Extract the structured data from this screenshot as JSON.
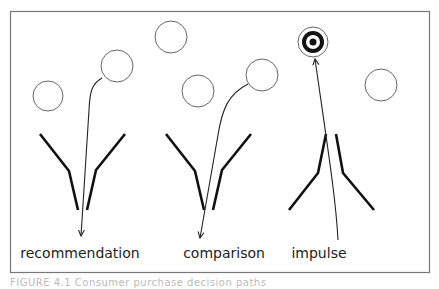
{
  "diagram": {
    "frame": {
      "x": 10,
      "y": 11,
      "width": 420,
      "height": 262,
      "stroke": "#777777"
    },
    "colors": {
      "line": "#111111",
      "circle": "#666666",
      "arrow": "#222222"
    },
    "panels": [
      {
        "label": "recommendation",
        "label_x": 80,
        "circles": [
          {
            "cx": 48,
            "cy": 96,
            "r": 15
          },
          {
            "cx": 117,
            "cy": 66,
            "r": 16
          }
        ],
        "funnel": "top",
        "arrow_path": "M 102 78 C 92 84, 90 90, 89 110 L 81 236",
        "arrow_tip": [
          81,
          236
        ]
      },
      {
        "label": "comparison",
        "label_x": 224,
        "circles": [
          {
            "cx": 171,
            "cy": 37,
            "r": 16
          },
          {
            "cx": 198,
            "cy": 91,
            "r": 16
          },
          {
            "cx": 262,
            "cy": 75,
            "r": 16
          }
        ],
        "funnel": "top",
        "arrow_path": "M 248 84 C 228 94, 222 110, 218 135 L 200 238",
        "arrow_tip": [
          200,
          238
        ]
      },
      {
        "label": "impulse",
        "label_x": 319,
        "circles": [
          {
            "cx": 381,
            "cy": 85,
            "r": 16
          }
        ],
        "target": {
          "cx": 313,
          "cy": 42,
          "r_outer": 15,
          "r_ring": 11,
          "r_white": 7,
          "r_dot": 3.5
        },
        "funnel": "bottom",
        "arrow_path": "M 338 240 C 336 200, 328 150, 315 59",
        "arrow_tip": [
          315,
          59
        ]
      }
    ]
  },
  "caption": "FIGURE 4.1  Consumer purchase decision paths"
}
